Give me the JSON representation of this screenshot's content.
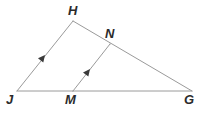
{
  "figure": {
    "type": "geometry-diagram",
    "background_color": "#ffffff",
    "stroke_color": "#9a9a9a",
    "label_color": "#2b2b2b",
    "stroke_width": 1,
    "width": 209,
    "height": 114
  },
  "points": [
    {
      "id": "J",
      "label": "J",
      "x": 17,
      "y": 91,
      "label_x": 6,
      "label_y": 93
    },
    {
      "id": "H",
      "label": "H",
      "x": 73,
      "y": 21,
      "label_x": 68,
      "label_y": 4
    },
    {
      "id": "G",
      "label": "G",
      "x": 192,
      "y": 91,
      "label_x": 184,
      "label_y": 93
    },
    {
      "id": "M",
      "label": "M",
      "x": 73,
      "y": 91,
      "label_x": 65,
      "label_y": 93
    },
    {
      "id": "N",
      "label": "N",
      "x": 110,
      "y": 44,
      "label_x": 105,
      "label_y": 27
    }
  ],
  "segments": [
    {
      "id": "JH",
      "from": "J",
      "to": "H",
      "x1": 17,
      "y1": 91,
      "x2": 73,
      "y2": 21,
      "marked_parallel": true
    },
    {
      "id": "HG",
      "from": "H",
      "to": "G",
      "x1": 73,
      "y1": 21,
      "x2": 192,
      "y2": 91,
      "marked_parallel": false
    },
    {
      "id": "JG",
      "from": "J",
      "to": "G",
      "x1": 17,
      "y1": 91,
      "x2": 192,
      "y2": 91,
      "marked_parallel": false
    },
    {
      "id": "MN",
      "from": "M",
      "to": "N",
      "x1": 73,
      "y1": 91,
      "x2": 110,
      "y2": 44,
      "marked_parallel": true
    }
  ],
  "parallel_marks": [
    {
      "id": "mark-JH",
      "on_segment": "JH",
      "x": 45,
      "y": 55,
      "angle_deg": -51.3,
      "tick_count": 1
    },
    {
      "id": "mark-MN",
      "on_segment": "MN",
      "x": 90,
      "y": 69,
      "angle_deg": -51.8,
      "tick_count": 1
    }
  ]
}
